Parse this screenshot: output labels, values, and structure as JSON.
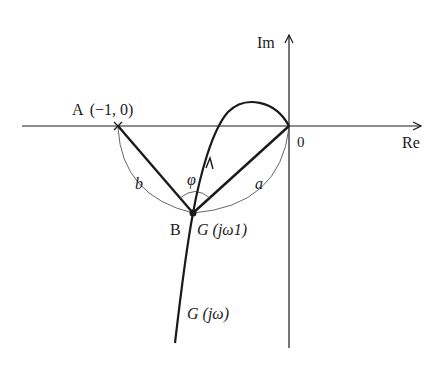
{
  "diagram": {
    "type": "nyquist-plot",
    "axes": {
      "real_label": "Re",
      "imag_label": "Im",
      "origin_label": "0"
    },
    "points": {
      "A": {
        "label": "A",
        "coords": "(−1, 0)"
      },
      "B": {
        "label": "B",
        "value": "G (jω1)"
      }
    },
    "curve_label": "G (jω)",
    "segments": {
      "a": "a",
      "b": "b"
    },
    "angle_label": "φ",
    "colors": {
      "stroke": "#1a1a1a",
      "arc": "#555555",
      "background": "#ffffff"
    }
  }
}
